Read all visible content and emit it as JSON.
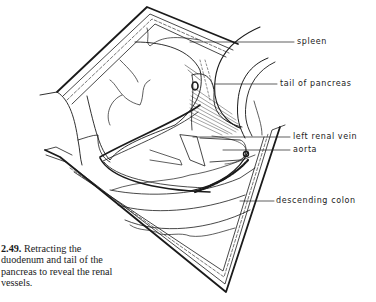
{
  "figure": {
    "number": "2.49.",
    "caption": " Retracting the duodenum and tail of the pancreas to reveal the renal vessels.",
    "labels": {
      "spleen": "spleen",
      "tail_of_pancreas": "tail of pancreas",
      "left_renal_vein": "left renal vein",
      "aorta": "aorta",
      "descending_colon": "descending colon"
    },
    "colors": {
      "ink": "#1a1a1a",
      "background": "#ffffff"
    }
  }
}
